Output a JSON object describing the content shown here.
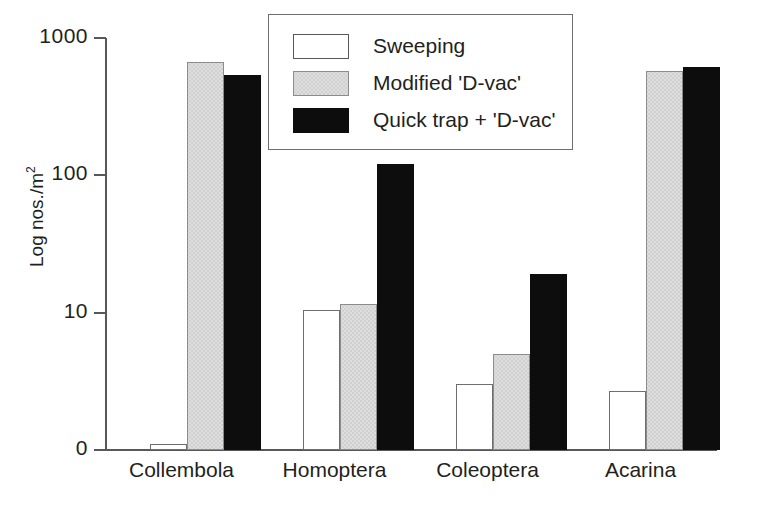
{
  "chart_data": {
    "type": "bar",
    "title": "",
    "subtitle": "",
    "xlabel": "",
    "ylabel": "Log nos./m",
    "ylabel_exponent": "2",
    "yscale": "log",
    "ylim": [
      1,
      1000
    ],
    "y_ticks": [
      "1000",
      "100",
      "10",
      "0"
    ],
    "y_tick_values": [
      1000,
      100,
      10,
      1
    ],
    "grid": false,
    "legend_position": "top-center",
    "categories": [
      "Collembola",
      "Homoptera",
      "Coleoptera",
      "Acarina"
    ],
    "series": [
      {
        "name": "Sweeping",
        "key": "sweeping",
        "color": "#ffffff",
        "values": [
          1.1,
          10.5,
          3.0,
          2.7
        ]
      },
      {
        "name": "Modified 'D-vac'",
        "key": "dvac",
        "color": "#dedede",
        "values": [
          670,
          11.5,
          5.0,
          580
        ]
      },
      {
        "name": "Quick trap + 'D-vac'",
        "key": "quick",
        "color": "#0d0d0d",
        "values": [
          540,
          120,
          19,
          620
        ]
      }
    ]
  },
  "legend": {
    "entries": [
      {
        "label": "Sweeping",
        "key": "sweeping"
      },
      {
        "label": "Modified 'D-vac'",
        "key": "dvac"
      },
      {
        "label": "Quick trap + 'D-vac'",
        "key": "quick"
      }
    ]
  },
  "axis": {
    "y_title_text": "Log nos./m",
    "y_title_sup": "2",
    "ticks": [
      {
        "label": "1000",
        "value": 1000
      },
      {
        "label": "100",
        "value": 100
      },
      {
        "label": "10",
        "value": 10
      },
      {
        "label": "0",
        "value": 1
      }
    ]
  }
}
